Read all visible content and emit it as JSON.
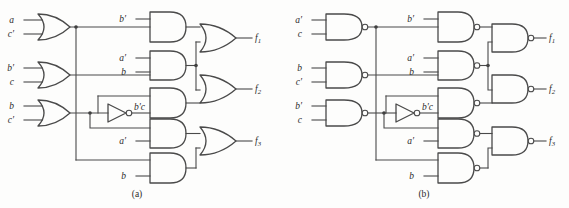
{
  "figure": {
    "type": "logic-circuit-diagram",
    "captions": [
      {
        "key": "a",
        "text": "(a)"
      },
      {
        "key": "b",
        "text": "(b)"
      }
    ]
  },
  "circuit_a": {
    "caption": "(a)",
    "gate_types": {
      "level1": "OR",
      "level2": "AND",
      "level3": "OR",
      "inverter": "NOT"
    },
    "level1_gates": [
      {
        "id": "a-g1",
        "type": "OR",
        "inputs": [
          "a",
          "c'"
        ],
        "output_label": ""
      },
      {
        "id": "a-g2",
        "type": "OR",
        "inputs": [
          "b'",
          "c"
        ],
        "output_label": ""
      },
      {
        "id": "a-g3",
        "type": "OR",
        "inputs": [
          "b",
          "c'"
        ],
        "output_label": ""
      }
    ],
    "inverter": {
      "id": "a-inv",
      "type": "NOT",
      "input_from": "a-g3",
      "output_label": "b'c"
    },
    "level2_gates": [
      {
        "id": "a-and1",
        "type": "AND",
        "inputs": [
          "b'",
          "(a+c')"
        ]
      },
      {
        "id": "a-and2",
        "type": "AND",
        "inputs": [
          "a'",
          "b"
        ]
      },
      {
        "id": "a-and3",
        "type": "AND",
        "inputs": [
          "(b'+c)",
          "(b'c)'"
        ]
      },
      {
        "id": "a-and4",
        "type": "AND",
        "inputs": [
          "b'c",
          "a'"
        ]
      },
      {
        "id": "a-and5",
        "type": "AND",
        "inputs": [
          "(a+c')",
          "b"
        ]
      }
    ],
    "outputs": [
      {
        "id": "a-f1",
        "type": "OR",
        "label": "f",
        "subscript": "1"
      },
      {
        "id": "a-f2",
        "type": "OR",
        "label": "f",
        "subscript": "2"
      },
      {
        "id": "a-f3",
        "type": "OR",
        "label": "f",
        "subscript": "3"
      }
    ],
    "input_labels": [
      "a",
      "c'",
      "b'",
      "c",
      "b",
      "c'",
      "b'",
      "a'",
      "b",
      "a'",
      "b"
    ],
    "intermediate_label": "b'c"
  },
  "circuit_b": {
    "caption": "(b)",
    "gate_types": {
      "level1": "NAND",
      "level2": "NAND",
      "level3": "NAND",
      "inverter": "NOT"
    },
    "level1_gates": [
      {
        "id": "b-g1",
        "type": "NAND",
        "inputs": [
          "a'",
          "c"
        ]
      },
      {
        "id": "b-g2",
        "type": "NAND",
        "inputs": [
          "b",
          "c'"
        ]
      },
      {
        "id": "b-g3",
        "type": "NAND",
        "inputs": [
          "b'",
          "c"
        ]
      }
    ],
    "inverter": {
      "id": "b-inv",
      "type": "NOT",
      "input_from": "b-g3",
      "output_label": "b'c"
    },
    "level2_gates": [
      {
        "id": "b-nand1",
        "type": "NAND",
        "inputs": [
          "b'",
          "(a'c)'"
        ]
      },
      {
        "id": "b-nand2",
        "type": "NAND",
        "inputs": [
          "a'",
          "b"
        ]
      },
      {
        "id": "b-nand3",
        "type": "NAND",
        "inputs": [
          "(bc')'",
          "(b'c)'"
        ]
      },
      {
        "id": "b-nand4",
        "type": "NAND",
        "inputs": [
          "b'c",
          "a'"
        ]
      },
      {
        "id": "b-nand5",
        "type": "NAND",
        "inputs": [
          "(a'c)'",
          "b"
        ]
      }
    ],
    "outputs": [
      {
        "id": "b-f1",
        "type": "NAND",
        "label": "f",
        "subscript": "1"
      },
      {
        "id": "b-f2",
        "type": "NAND",
        "label": "f",
        "subscript": "2"
      },
      {
        "id": "b-f3",
        "type": "NAND",
        "label": "f",
        "subscript": "3"
      }
    ],
    "input_labels": [
      "a'",
      "c",
      "b",
      "c'",
      "b'",
      "c",
      "b'",
      "a'",
      "b",
      "a'",
      "b"
    ],
    "intermediate_label": "b'c"
  },
  "labels": {
    "a": "a",
    "a_prime": "a′",
    "b": "b",
    "b_prime": "b′",
    "c": "c",
    "c_prime": "c′",
    "bprime_c": "b′c",
    "f": "f",
    "one": "1",
    "two": "2",
    "three": "3"
  },
  "colors": {
    "background": "#fdfdfc",
    "stroke": "#4a4a4a",
    "text": "#2b2b2b",
    "dot": "#3a3a3a"
  }
}
